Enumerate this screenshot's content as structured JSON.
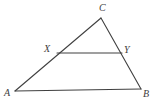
{
  "figure": {
    "background_color": "#ffffff",
    "stroke_color": "#404040",
    "label_color": "#3d3d3d",
    "width": 161,
    "height": 107
  },
  "points": {
    "A": {
      "label": "A",
      "x": 15,
      "y": 91,
      "label_x": 4,
      "label_y": 88
    },
    "B": {
      "label": "B",
      "x": 141,
      "y": 89,
      "label_x": 143,
      "label_y": 89
    },
    "C": {
      "label": "C",
      "x": 101,
      "y": 18,
      "label_x": 99,
      "label_y": 3
    },
    "X": {
      "label": "X",
      "x": 57,
      "y": 53,
      "label_x": 44,
      "label_y": 44
    },
    "Y": {
      "label": "Y",
      "x": 122,
      "y": 53,
      "label_x": 124,
      "label_y": 45
    }
  },
  "segments": [
    {
      "name": "side-AC",
      "from": "A",
      "to": "C",
      "x1": 15,
      "y1": 91,
      "x2": 101,
      "y2": 18
    },
    {
      "name": "side-CB",
      "from": "C",
      "to": "B",
      "x1": 101,
      "y1": 18,
      "x2": 141,
      "y2": 89
    },
    {
      "name": "side-AB",
      "from": "A",
      "to": "B",
      "x1": 15,
      "y1": 91,
      "x2": 141,
      "y2": 89
    },
    {
      "name": "midsegment-XY",
      "from": "X",
      "to": "Y",
      "x1": 57,
      "y1": 53,
      "x2": 122,
      "y2": 53
    }
  ]
}
